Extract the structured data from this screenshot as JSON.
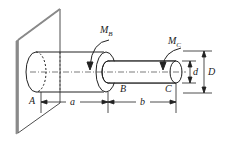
{
  "diagram": {
    "type": "stepped shaft fixed to wall",
    "labels": {
      "moment_b": "M",
      "moment_b_sub": "B",
      "moment_c": "M",
      "moment_c_sub": "C",
      "point_a": "A",
      "point_b": "B",
      "point_c": "C",
      "length_a": "a",
      "length_b": "b",
      "diameter_small": "d",
      "diameter_large": "D"
    },
    "colors": {
      "line": "#222222",
      "wall_edge": "#8a8a8a",
      "background": "#ffffff"
    }
  }
}
